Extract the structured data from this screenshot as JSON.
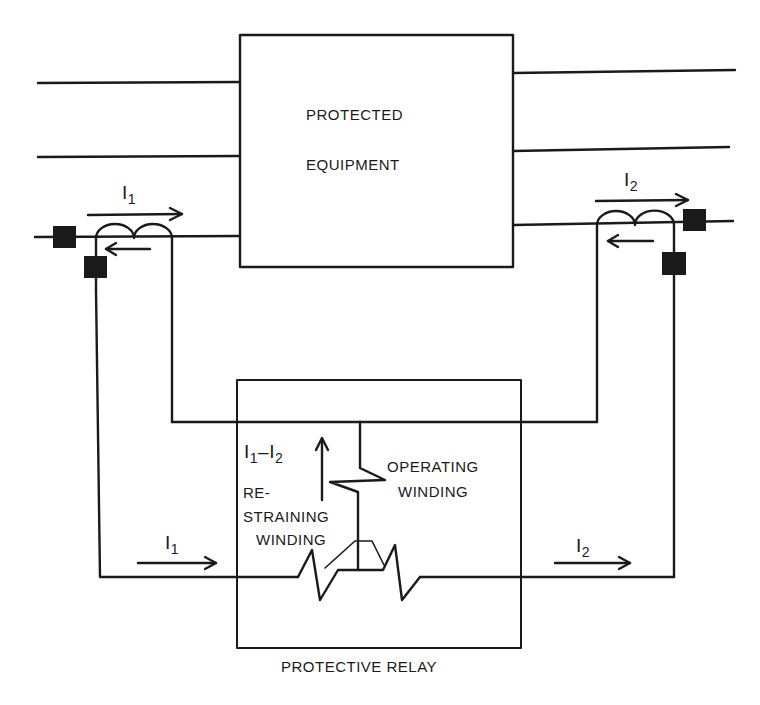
{
  "diagram": {
    "type": "differential relay protection schematic",
    "equipment": {
      "line1": "PROTECTED",
      "line2": "EQUIPMENT"
    },
    "relay": {
      "caption": "PROTECTIVE RELAY",
      "operating_winding": {
        "line1": "OPERATING",
        "line2": "WINDING"
      },
      "restraining_winding": {
        "line1": "RE-",
        "line2": "STRAINING",
        "line3": "WINDING"
      },
      "differential_current": {
        "a": "I",
        "a_sub": "1",
        "sep": "–",
        "b": "I",
        "b_sub": "2"
      }
    },
    "currents": {
      "left_ct": {
        "base": "I",
        "sub": "1"
      },
      "right_ct": {
        "base": "I",
        "sub": "2"
      },
      "left_loop": {
        "base": "I",
        "sub": "1"
      },
      "right_loop": {
        "base": "I",
        "sub": "2"
      }
    },
    "colors": {
      "ink": "#1a1a1a",
      "background": "#ffffff"
    }
  }
}
